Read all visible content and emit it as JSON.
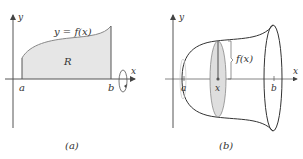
{
  "panels": [
    {
      "id": "a",
      "caption": "(a)",
      "axis_x_label": "x",
      "axis_y_label": "y",
      "curve_label": "y = f(x)",
      "region_label": "R",
      "tick_a": "a",
      "tick_b": "b",
      "rotation_indicator": "rotation-arrow-about-x-axis"
    },
    {
      "id": "b",
      "caption": "(b)",
      "axis_x_label": "x",
      "axis_y_label": "y",
      "radius_label": "f(x)",
      "tick_a": "a",
      "tick_x": "x",
      "tick_b": "b"
    }
  ],
  "colors": {
    "region_fill": "#e6e6e6",
    "cross_section_fill": "#dedede",
    "line": "#444444",
    "axis": "#555555"
  }
}
